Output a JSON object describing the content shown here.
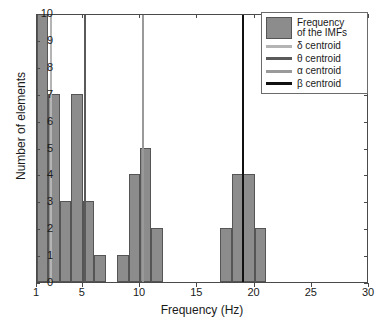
{
  "chart_data": {
    "type": "bar",
    "title": "",
    "xlabel": "Frequency (Hz)",
    "ylabel": "Number of elements",
    "xlim": [
      1,
      30
    ],
    "ylim": [
      0,
      10
    ],
    "grid": false,
    "xticks": [
      1,
      5,
      10,
      15,
      20,
      25,
      30
    ],
    "yticks": [
      0,
      1,
      2,
      3,
      4,
      5,
      6,
      7,
      8,
      9,
      10
    ],
    "bar_color": "#8c8c8c",
    "bar_edge_color": "#555555",
    "bin_edges": [
      1,
      2,
      3,
      4,
      5,
      6,
      7,
      8,
      9,
      10,
      11,
      12,
      17,
      18,
      19,
      20,
      21
    ],
    "bins": [
      {
        "start": 1,
        "end": 2,
        "value": 10
      },
      {
        "start": 2,
        "end": 3,
        "value": 7
      },
      {
        "start": 3,
        "end": 4,
        "value": 3
      },
      {
        "start": 4,
        "end": 5,
        "value": 7
      },
      {
        "start": 5,
        "end": 6,
        "value": 3
      },
      {
        "start": 6,
        "end": 7,
        "value": 1
      },
      {
        "start": 8,
        "end": 9,
        "value": 1
      },
      {
        "start": 9,
        "end": 10,
        "value": 4
      },
      {
        "start": 10,
        "end": 11,
        "value": 5
      },
      {
        "start": 11,
        "end": 12,
        "value": 2
      },
      {
        "start": 17,
        "end": 18,
        "value": 2
      },
      {
        "start": 18,
        "end": 19,
        "value": 4
      },
      {
        "start": 19,
        "end": 20,
        "value": 4
      },
      {
        "start": 20,
        "end": 21,
        "value": 2
      }
    ],
    "centroids": [
      {
        "name": "delta",
        "symbol": "δ",
        "x": 2.2,
        "color": "#b4b4b4"
      },
      {
        "name": "theta",
        "symbol": "θ",
        "x": 5.2,
        "color": "#5a5a5a"
      },
      {
        "name": "alpha",
        "symbol": "α",
        "x": 10.3,
        "color": "#9a9a9a"
      },
      {
        "name": "beta",
        "symbol": "β",
        "x": 19.0,
        "color": "#111111"
      }
    ],
    "legend": {
      "position": "top-right",
      "entries": [
        {
          "kind": "patch",
          "label": "Frequency of the IMFs",
          "color": "#8c8c8c"
        },
        {
          "kind": "line",
          "label": "δ centroid",
          "color": "#b4b4b4"
        },
        {
          "kind": "line",
          "label": "θ centroid",
          "color": "#5a5a5a"
        },
        {
          "kind": "line",
          "label": "α centroid",
          "color": "#9a9a9a"
        },
        {
          "kind": "line",
          "label": "β centroid",
          "color": "#111111"
        }
      ]
    }
  },
  "axes": {
    "xtick_labels": [
      "1",
      "5",
      "10",
      "15",
      "20",
      "25",
      "30"
    ],
    "ytick_labels": [
      "0",
      "1",
      "2",
      "3",
      "4",
      "5",
      "6",
      "7",
      "8",
      "9",
      "10"
    ],
    "xlabel": "Frequency (Hz)",
    "ylabel": "Number of elements"
  },
  "legend_labels": {
    "patch_line1": "Frequency",
    "patch_line2": "of the IMFs",
    "delta": "δ centroid",
    "theta": "θ centroid",
    "alpha": "α centroid",
    "beta": "β centroid"
  }
}
